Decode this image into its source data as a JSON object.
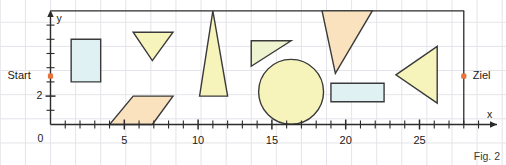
{
  "figure": {
    "caption": "Fig. 2",
    "axis": {
      "x_label": "x",
      "y_label": "y",
      "origin_label": "0",
      "x_ticks_major": [
        5,
        10,
        15,
        20,
        25
      ],
      "x_tick_labels": [
        "5",
        "10",
        "15",
        "20",
        "25"
      ],
      "x_tick_minor_step": 1,
      "x_min": 0,
      "x_max": 30,
      "y_ticks_major": [
        2
      ],
      "y_tick_labels": [
        "2"
      ],
      "y_tick_minor_step": 1,
      "y_min": 0,
      "y_max": 8
    },
    "markers": [
      {
        "name": "start",
        "label": "Start",
        "x": 0,
        "y": 3.4,
        "color": "#e8743b",
        "label_side": "left"
      },
      {
        "name": "ziel",
        "label": "Ziel",
        "x": 28,
        "y": 3.4,
        "color": "#e8743b",
        "label_side": "right"
      }
    ],
    "boundary": {
      "top_line_y": 8,
      "right_line_x": 28
    },
    "colors": {
      "stroke": "#3a3a3a",
      "grid": "#e4e4ea",
      "axis": "#2b2b2b",
      "fill_blue": "#dff1f2",
      "fill_yellow": "#f7f4bb",
      "fill_orange": "#fae2bf",
      "fill_green": "#edf4cf",
      "accent": "#e8743b",
      "background": "#ffffff"
    },
    "shapes": [
      {
        "name": "rectangle-blue-tall",
        "type": "rect",
        "fill": "#dff1f2",
        "points": [
          [
            1.4,
            3.0
          ],
          [
            1.4,
            6.0
          ],
          [
            3.4,
            6.0
          ],
          [
            3.4,
            3.0
          ]
        ]
      },
      {
        "name": "triangle-yellow-down",
        "type": "triangle",
        "fill": "#f7f4bb",
        "points": [
          [
            5.6,
            6.5
          ],
          [
            8.3,
            6.5
          ],
          [
            6.9,
            4.5
          ]
        ]
      },
      {
        "name": "parallelogram-orange",
        "type": "parallelogram",
        "fill": "#fae2bf",
        "points": [
          [
            4.0,
            0.0
          ],
          [
            6.9,
            0.0
          ],
          [
            8.3,
            2.0
          ],
          [
            5.6,
            2.0
          ]
        ]
      },
      {
        "name": "triangle-yellow-tall",
        "type": "triangle",
        "fill": "#f7f4bb",
        "points": [
          [
            10.1,
            2.0
          ],
          [
            12.0,
            2.0
          ],
          [
            11.0,
            8.0
          ]
        ]
      },
      {
        "name": "triangle-green-right",
        "type": "triangle",
        "fill": "#edf4cf",
        "points": [
          [
            13.6,
            4.1
          ],
          [
            16.3,
            5.9
          ],
          [
            13.6,
            5.9
          ]
        ]
      },
      {
        "name": "circle-yellow",
        "type": "circle",
        "fill": "#f7f4bb",
        "center": [
          16.3,
          2.3
        ],
        "radius": 2.2
      },
      {
        "name": "triangle-orange-funnel",
        "type": "triangle",
        "fill": "#fae2bf",
        "points": [
          [
            18.4,
            8.0
          ],
          [
            21.8,
            8.0
          ],
          [
            19.3,
            3.6
          ]
        ]
      },
      {
        "name": "rectangle-blue-wide",
        "type": "rect",
        "fill": "#dff1f2",
        "points": [
          [
            19.0,
            1.6
          ],
          [
            22.6,
            1.6
          ],
          [
            22.6,
            2.9
          ],
          [
            19.0,
            2.9
          ]
        ]
      },
      {
        "name": "triangle-yellow-left",
        "type": "triangle",
        "fill": "#f7f4bb",
        "points": [
          [
            23.4,
            3.5
          ],
          [
            26.2,
            5.5
          ],
          [
            26.2,
            1.5
          ]
        ]
      }
    ]
  }
}
